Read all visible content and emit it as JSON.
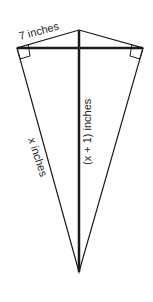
{
  "figure": {
    "type": "kite",
    "labels": {
      "top_left_side": "7 inches",
      "vertical_diagonal": "(x + 1) inches",
      "lower_left_side": "x inches"
    },
    "right_angle_marks": 2,
    "stroke_color": "#1a1a1a",
    "background": "#ffffff"
  }
}
